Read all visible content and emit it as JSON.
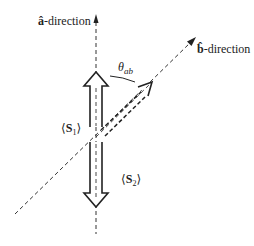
{
  "diagram": {
    "labels": {
      "a_direction": {
        "hat": "â",
        "text": "-direction"
      },
      "b_direction": {
        "hat": "b̂",
        "text": "-direction"
      },
      "theta": {
        "symbol": "θ",
        "subscript": "ab"
      },
      "s1": {
        "open": "⟨",
        "symbol": "S",
        "subscript": "1",
        "close": "⟩"
      },
      "s2": {
        "open": "⟨",
        "symbol": "S",
        "subscript": "2",
        "close": "⟩"
      }
    },
    "elements": {
      "a_axis": "dashed vertical axis with arrowhead pointing up",
      "b_axis": "dashed diagonal axis with arrowhead pointing up-right",
      "s1_arrow": "hollow arrow pointing up along a-direction",
      "s2_arrow": "hollow arrow pointing down along a-direction",
      "b_arrow": "dashed hollow arrow pointing along b-direction",
      "theta_arc": "arc between a-direction and b-direction arrows"
    },
    "colors": {
      "stroke": "#222222",
      "background": "#ffffff"
    }
  }
}
